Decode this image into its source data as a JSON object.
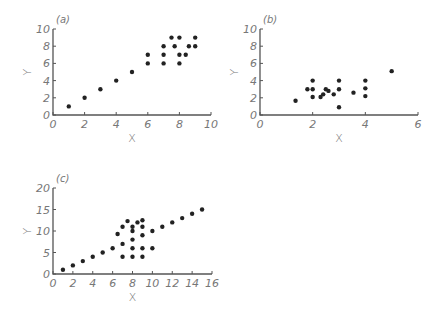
{
  "chart_data": [
    {
      "type": "scatter",
      "panel_label": "(a)",
      "title": "",
      "xlabel": "X",
      "ylabel": "Y",
      "xlim": [
        0,
        10
      ],
      "ylim": [
        0,
        10
      ],
      "xticks": [
        0,
        2,
        4,
        6,
        8,
        10
      ],
      "yticks": [
        0,
        2,
        4,
        6,
        8,
        10
      ],
      "grid": false,
      "points": [
        [
          1,
          1
        ],
        [
          2,
          2
        ],
        [
          3,
          3
        ],
        [
          4,
          4
        ],
        [
          5,
          5
        ],
        [
          6,
          6
        ],
        [
          6,
          7
        ],
        [
          7,
          6
        ],
        [
          7,
          7
        ],
        [
          7,
          8
        ],
        [
          7.5,
          9
        ],
        [
          7.7,
          8
        ],
        [
          8,
          6
        ],
        [
          8,
          7
        ],
        [
          8,
          9
        ],
        [
          8.4,
          7
        ],
        [
          8.6,
          8
        ],
        [
          9,
          8
        ],
        [
          9,
          9
        ]
      ],
      "frame": {
        "ox": 53,
        "oy": 115,
        "xend": 211,
        "ytop": 29
      }
    },
    {
      "type": "scatter",
      "panel_label": "(b)",
      "title": "",
      "xlabel": "X",
      "ylabel": "Y",
      "xlim": [
        0,
        6
      ],
      "ylim": [
        0,
        10
      ],
      "xticks": [
        0,
        2,
        4,
        6
      ],
      "yticks": [
        0,
        2,
        4,
        6,
        8,
        10
      ],
      "grid": false,
      "points": [
        [
          1.35,
          1.65
        ],
        [
          1.8,
          3
        ],
        [
          2,
          2.1
        ],
        [
          2,
          3
        ],
        [
          2,
          4
        ],
        [
          2.3,
          2.1
        ],
        [
          2.4,
          2.4
        ],
        [
          2.5,
          3
        ],
        [
          2.6,
          2.8
        ],
        [
          2.8,
          2.4
        ],
        [
          3,
          0.9
        ],
        [
          3,
          3
        ],
        [
          3,
          4
        ],
        [
          3.55,
          2.6
        ],
        [
          4,
          2.2
        ],
        [
          4,
          3.1
        ],
        [
          4,
          4
        ],
        [
          5,
          5.1
        ]
      ],
      "frame": {
        "ox": 260,
        "oy": 115,
        "xend": 418,
        "ytop": 29
      }
    },
    {
      "type": "scatter",
      "panel_label": "(c)",
      "title": "",
      "xlabel": "X",
      "ylabel": "Y",
      "xlim": [
        0,
        16
      ],
      "ylim": [
        0,
        20
      ],
      "xticks": [
        0,
        2,
        4,
        6,
        8,
        10,
        12,
        14,
        16
      ],
      "yticks": [
        0,
        5,
        10,
        15,
        20
      ],
      "grid": false,
      "points": [
        [
          1,
          1
        ],
        [
          2,
          2
        ],
        [
          3,
          3
        ],
        [
          4,
          4
        ],
        [
          5,
          5
        ],
        [
          6,
          6
        ],
        [
          6.5,
          9.3
        ],
        [
          7,
          4
        ],
        [
          7,
          7
        ],
        [
          7,
          11
        ],
        [
          7.5,
          12.3
        ],
        [
          8,
          4
        ],
        [
          8,
          6
        ],
        [
          8,
          8
        ],
        [
          8,
          10
        ],
        [
          8,
          11
        ],
        [
          8.5,
          12
        ],
        [
          9,
          4
        ],
        [
          9,
          6
        ],
        [
          9,
          9
        ],
        [
          9,
          11
        ],
        [
          9,
          12.5
        ],
        [
          10,
          6
        ],
        [
          10,
          10
        ],
        [
          11,
          11
        ],
        [
          12,
          12
        ],
        [
          13,
          13
        ],
        [
          14,
          14
        ],
        [
          15,
          15
        ]
      ],
      "frame": {
        "ox": 53,
        "oy": 274,
        "xend": 212,
        "ytop": 188
      }
    }
  ]
}
